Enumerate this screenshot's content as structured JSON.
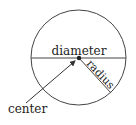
{
  "diagram": {
    "labels": {
      "diameter": "diameter",
      "radius": "radius",
      "center": "center"
    },
    "colors": {
      "stroke": "#444444",
      "text": "#222222",
      "background": "#ffffff"
    }
  }
}
